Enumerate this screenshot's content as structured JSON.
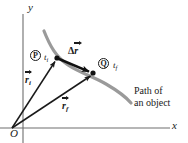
{
  "figure": {
    "background_color": "#ffffff",
    "ink_color": "#1a1a1a",
    "path_color": "#999999"
  },
  "axes": {
    "y_label": "y",
    "x_label": "x",
    "origin_label": "O"
  },
  "points": [
    {
      "name": "initial-position",
      "marker_label": "P",
      "time_label": "t",
      "time_sub": "i",
      "x": 57,
      "y": 58
    },
    {
      "name": "final-position",
      "marker_label": "Q",
      "time_label": "t",
      "time_sub": "f",
      "x": 93,
      "y": 73
    }
  ],
  "vectors": [
    {
      "name": "initial-position-vector",
      "symbol": "r",
      "subscript": "i",
      "from": [
        12,
        128
      ],
      "to": [
        57,
        58
      ]
    },
    {
      "name": "final-position-vector",
      "symbol": "r",
      "subscript": "f",
      "from": [
        12,
        128
      ],
      "to": [
        93,
        73
      ]
    },
    {
      "name": "displacement-vector",
      "symbol": "r",
      "prefix": "Δ",
      "subscript": "",
      "from": [
        57,
        58
      ],
      "to": [
        93,
        73
      ]
    }
  ],
  "labels": {
    "delta_r_prefix": "Δ",
    "delta_r_symbol": "r",
    "caption_line1": "Path of",
    "caption_line2": "an object"
  }
}
